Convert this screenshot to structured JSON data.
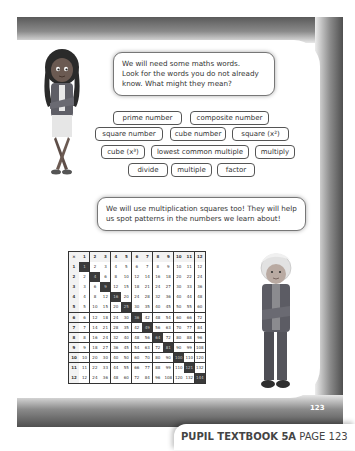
{
  "page": {
    "number": "123",
    "caption_bold": "PUPIL TEXTBOOK 5A",
    "caption_rest": "PAGE 123"
  },
  "bubbles": [
    {
      "text_lines": [
        "We will need some maths words.",
        "Look for the words you do not already",
        "know. What might they mean?"
      ]
    },
    {
      "text_lines": [
        "We will use multiplication squares too! They will help",
        "us spot patterns in the numbers we learn about!"
      ]
    }
  ],
  "vocabulary": [
    {
      "label": "prime number"
    },
    {
      "label": "composite number"
    },
    {
      "label": "square number"
    },
    {
      "label": "cube number"
    },
    {
      "label": "square (x²)"
    },
    {
      "label": "cube (x³)"
    },
    {
      "label": "lowest common multiple"
    },
    {
      "label": "multiply"
    },
    {
      "label": "divide"
    },
    {
      "label": "multiple"
    },
    {
      "label": "factor"
    }
  ],
  "multiplication_square": {
    "corner": "×",
    "size": 12,
    "highlight": "diagonal (square numbers) shaded dark",
    "colors": {
      "header": "#f2f2f2",
      "highlight": "#3a3a3a",
      "cell": "#ffffff",
      "border": "#333333"
    }
  },
  "characters": [
    {
      "name": "girl",
      "position": "top-left"
    },
    {
      "name": "boy",
      "position": "bottom-right"
    }
  ]
}
